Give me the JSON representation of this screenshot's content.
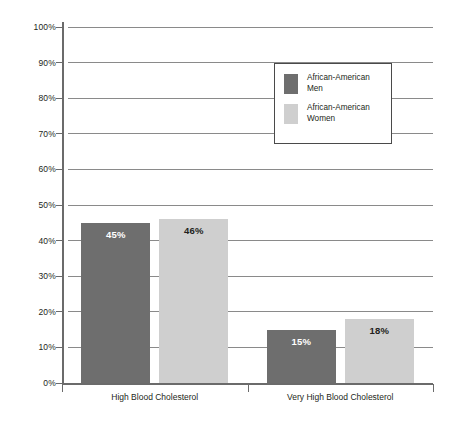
{
  "chart_data": {
    "type": "bar",
    "title": "",
    "xlabel": "",
    "ylabel": "",
    "ylim": [
      0,
      100
    ],
    "grid": true,
    "legend_position": "inside-top-right",
    "categories": [
      "High Blood Cholesterol",
      "Very High Blood Cholesterol"
    ],
    "y_ticks": [
      "0%",
      "10%",
      "20%",
      "30%",
      "40%",
      "50%",
      "60%",
      "70%",
      "80%",
      "90%",
      "100%"
    ],
    "y_tick_values": [
      0,
      10,
      20,
      30,
      40,
      50,
      60,
      70,
      80,
      90,
      100
    ],
    "series": [
      {
        "name": "African-American\nMen",
        "color": "#6e6e6e",
        "values": [
          45,
          15
        ],
        "labels": [
          "45%",
          "15%"
        ]
      },
      {
        "name": "African-American\nWomen",
        "color": "#cfcfcf",
        "values": [
          46,
          18
        ],
        "labels": [
          "46%",
          "18%"
        ]
      }
    ]
  },
  "legend": {
    "items": [
      {
        "label": "African-American\nMen",
        "color": "#6e6e6e"
      },
      {
        "label": "African-American\nWomen",
        "color": "#cfcfcf"
      }
    ]
  },
  "colors": {
    "series_dark": "#6e6e6e",
    "series_light": "#cfcfcf",
    "axis": "#6b6b6b",
    "gridline": "#8a8a8a",
    "text": "#231f20",
    "background": "#ffffff"
  }
}
